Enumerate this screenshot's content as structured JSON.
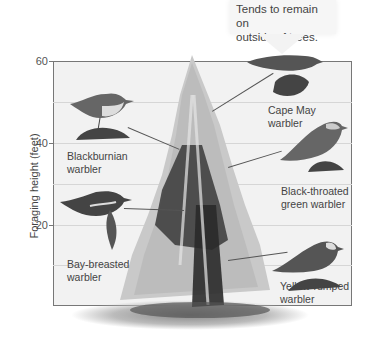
{
  "callout": {
    "text_line1": "Tends to remain on",
    "text_line2": "outside of trees."
  },
  "axis": {
    "ylabel": "Foraging height (feet)",
    "ticks": [
      "60",
      "40",
      "20"
    ]
  },
  "birds": [
    {
      "name": "blackburnian",
      "line1": "Blackburnian",
      "line2": "warbler"
    },
    {
      "name": "cape-may",
      "line1": "Cape May",
      "line2": "warbler"
    },
    {
      "name": "black-throated-green",
      "line1": "Black-throated",
      "line2": "green warbler"
    },
    {
      "name": "bay-breasted",
      "line1": "Bay-breasted",
      "line2": "warbler"
    },
    {
      "name": "yellow-rumped",
      "line1": "Yellow-rumped",
      "line2": "warbler"
    }
  ],
  "colors": {
    "plot_bg": "#f2f2f2",
    "tree_light": "#c4c4c4",
    "tree_dark": "#2a2a2a",
    "text": "#444444"
  }
}
